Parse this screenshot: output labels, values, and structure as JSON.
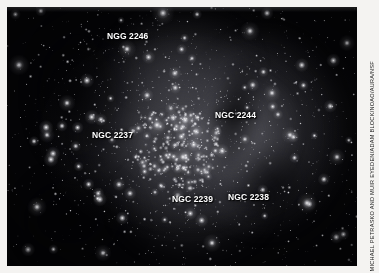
{
  "figure": {
    "type": "astronomical-photograph",
    "plate_background": "#040406",
    "page_background": "#ffffff",
    "label_color": "#ffffff"
  },
  "labels": [
    {
      "id": "ngc-2246",
      "text": "NGG 2246",
      "x": 107,
      "y": 31
    },
    {
      "id": "ngc-2244",
      "text": "NGC 2244",
      "x": 215,
      "y": 110
    },
    {
      "id": "ngc-2237",
      "text": "NGC 2237",
      "x": 92,
      "y": 130
    },
    {
      "id": "ngc-2239",
      "text": "NGC 2239",
      "x": 172,
      "y": 194
    },
    {
      "id": "ngc-2238",
      "text": "NGC 2238",
      "x": 228,
      "y": 192
    }
  ],
  "credit": {
    "text": "MICHAEL PETRASKO AND MUIR EYEDEN/ADAM BLOCK/NOAO/AURA/NSF"
  }
}
